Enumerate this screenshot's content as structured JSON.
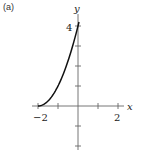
{
  "panel_label": "(a)",
  "chart_data": {
    "type": "line",
    "title": "",
    "xlabel": "x",
    "ylabel": "y",
    "xlim": [
      -2,
      2
    ],
    "ylim": [
      -2,
      4
    ],
    "x_tick_labels": [
      "-2",
      "2"
    ],
    "y_tick_labels": [
      "4"
    ],
    "x_ticks": [
      -2,
      -1,
      0,
      1,
      2
    ],
    "y_ticks": [
      -2,
      -1,
      1,
      2,
      3,
      4
    ],
    "grid": false,
    "series": [
      {
        "name": "curve",
        "x": [
          -2,
          -1.5,
          -1,
          -0.5,
          0,
          0.05
        ],
        "y": [
          0,
          0.25,
          1,
          2.25,
          4,
          4.2
        ],
        "color": "#111111"
      }
    ]
  }
}
